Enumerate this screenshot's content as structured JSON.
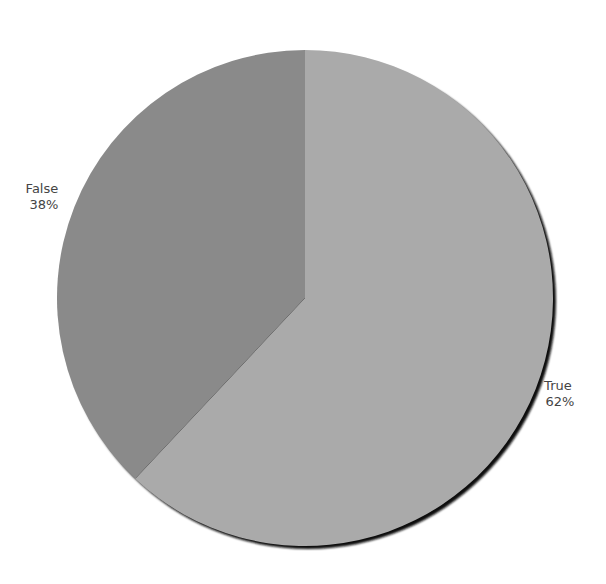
{
  "chart_data": {
    "type": "pie",
    "title": "",
    "categories": [
      "True",
      "False"
    ],
    "values": [
      62,
      38
    ],
    "labels": [
      "True\n62%",
      "False\n38%"
    ],
    "colors": [
      "#aaaaaa",
      "#8a8a8a"
    ],
    "start_angle_deg": 90,
    "direction": "clockwise",
    "shadow": true,
    "legend": "none"
  },
  "slices": [
    {
      "name": "True",
      "percent_label": "62%",
      "value": 62,
      "color": "#aaaaaa"
    },
    {
      "name": "False",
      "percent_label": "38%",
      "value": 38,
      "color": "#8a8a8a"
    }
  ]
}
